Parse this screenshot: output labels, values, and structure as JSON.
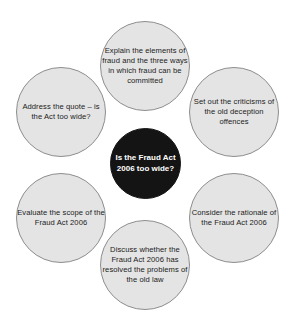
{
  "diagram": {
    "type": "hub-and-spoke-circles",
    "shape": "six petal circles around a central circle",
    "colors": {
      "petal_fill": "#e4e4e4",
      "petal_stroke": "#8d8d8d",
      "petal_text": "#1b1b1b",
      "hub_fill": "#141414",
      "hub_text": "#ffffff",
      "background": "#ffffff"
    },
    "center": {
      "label": "Is the Fraud Act 2006 too wide?",
      "line1": "Is the Fraud",
      "line2": "Act 2006",
      "line3": "too wide?"
    },
    "nodes": [
      {
        "position": "top",
        "label": "Explain the elements of fraud and the three ways in which fraud can be committed"
      },
      {
        "position": "top-right",
        "label": "Set out the criticisms of the old deception offences"
      },
      {
        "position": "bottom-right",
        "label": "Consider the rationale of the Fraud Act 2006"
      },
      {
        "position": "bottom",
        "label": "Discuss whether the Fraud Act 2006 has resolved the problems of the old law"
      },
      {
        "position": "bottom-left",
        "label": "Evaluate the scope of the Fraud Act 2006"
      },
      {
        "position": "top-left",
        "label": "Address the quote – is the Act too wide?"
      }
    ]
  }
}
